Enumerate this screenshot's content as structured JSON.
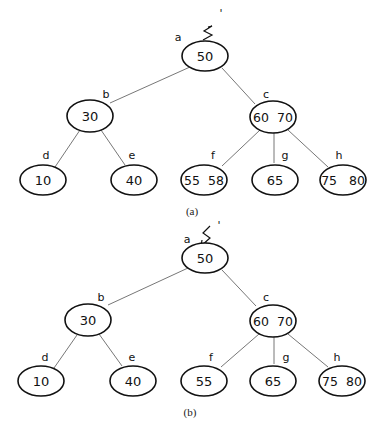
{
  "figure": {
    "panels": [
      {
        "caption": "(a)",
        "pointer_label": "S",
        "pointer_prime": "'",
        "nodes": {
          "a": {
            "label": "a",
            "keys": "50"
          },
          "b": {
            "label": "b",
            "keys": "30"
          },
          "c": {
            "label": "c",
            "keys": "60  70"
          },
          "d": {
            "label": "d",
            "keys": "10"
          },
          "e": {
            "label": "e",
            "keys": "40"
          },
          "f": {
            "label": "f",
            "keys": "55  58"
          },
          "g": {
            "label": "g",
            "keys": "65"
          },
          "h": {
            "label": "h",
            "keys": "75   80"
          }
        }
      },
      {
        "caption": "(b)",
        "pointer_label": "S",
        "pointer_prime": "'",
        "nodes": {
          "a": {
            "label": "a",
            "keys": "50"
          },
          "b": {
            "label": "b",
            "keys": "30"
          },
          "c": {
            "label": "c",
            "keys": "60  70"
          },
          "d": {
            "label": "d",
            "keys": "10"
          },
          "e": {
            "label": "e",
            "keys": "40"
          },
          "f": {
            "label": "f",
            "keys": "55"
          },
          "g": {
            "label": "g",
            "keys": "65"
          },
          "h": {
            "label": "h",
            "keys": "75  80"
          }
        }
      }
    ],
    "edges": [
      [
        "a",
        "b"
      ],
      [
        "a",
        "c"
      ],
      [
        "b",
        "d"
      ],
      [
        "b",
        "e"
      ],
      [
        "c",
        "f"
      ],
      [
        "c",
        "g"
      ],
      [
        "c",
        "h"
      ]
    ]
  }
}
